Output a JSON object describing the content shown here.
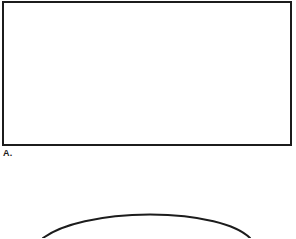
{
  "document": {
    "type": "figure-sheet",
    "background_color": "#ffffff",
    "ink_color": "#1c1c1c",
    "width": 296,
    "height": 238
  },
  "panels": [
    {
      "id": "panel-a",
      "label": "A.",
      "shape": "rectangle",
      "description": "empty rectangular outline",
      "stroke_color": "#1c1c1c",
      "stroke_width": 2,
      "fill_color": "#ffffff",
      "bounds": {
        "x": 2,
        "y": 1,
        "width": 290,
        "height": 145
      }
    },
    {
      "id": "panel-b",
      "label": "",
      "shape": "arc",
      "description": "top of a curved outline entering from the bottom edge, cropped by the sheet",
      "stroke_color": "#1c1c1c",
      "stroke_width": 2,
      "fill_color": "none",
      "apex": {
        "x": 150,
        "y": 214
      },
      "left_end": {
        "x": 43,
        "y": 238
      },
      "right_end": {
        "x": 250,
        "y": 238
      }
    }
  ],
  "panel_a": {
    "label": "A."
  }
}
